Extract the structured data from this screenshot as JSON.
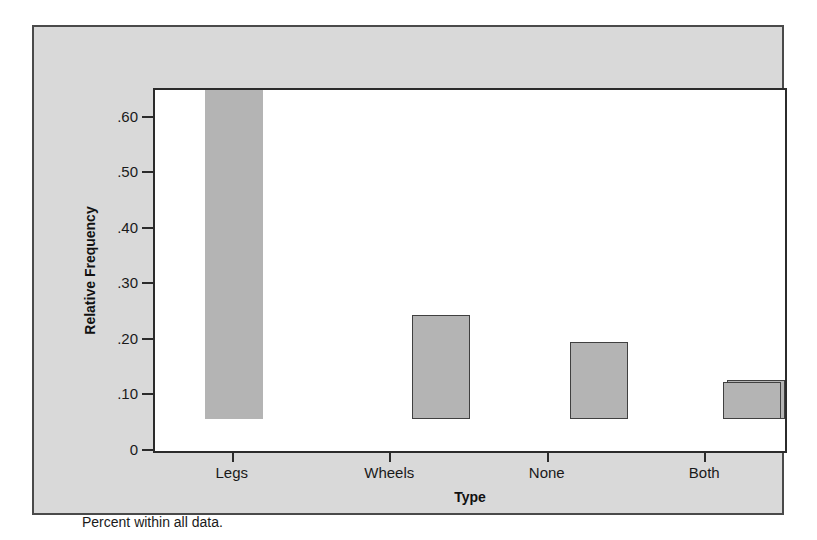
{
  "chart_data": {
    "type": "bar",
    "title": "",
    "categories": [
      "Legs",
      "Wheels",
      "None",
      "Both"
    ],
    "values": [
      0.593,
      0.187,
      0.139,
      0.07
    ],
    "xlabel": "Type",
    "ylabel": "Relative Frequency",
    "ylim": [
      0,
      0.65
    ],
    "yticks": [
      0,
      0.1,
      0.2,
      0.3,
      0.4,
      0.5,
      0.6
    ],
    "ytick_labels": [
      "0",
      ".10",
      ".20",
      ".30",
      ".40",
      ".50",
      ".60"
    ],
    "grid": false,
    "legend": "none",
    "bar_color": "#b4b4b4",
    "bar_edge_color": "#404040",
    "plot_background": "#ffffff",
    "panel_background": "#d9d9d9",
    "panel_border_color": "#4a4a4a",
    "axis_color": "#2b2b2b",
    "footnote": "Percent within all data."
  }
}
